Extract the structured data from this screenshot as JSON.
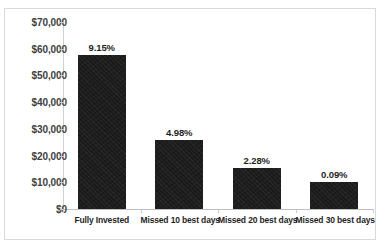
{
  "chart_data": {
    "type": "bar",
    "title": "",
    "xlabel": "",
    "ylabel": "",
    "categories": [
      "Fully Invested",
      "Missed 10 best days",
      "Missed 20 best days",
      "Missed 30 best days"
    ],
    "values": [
      57500,
      26000,
      15400,
      10000
    ],
    "data_labels": [
      "9.15%",
      "4.98%",
      "2.28%",
      "0.09%"
    ],
    "ylim": [
      0,
      70000
    ],
    "ytick_values": [
      0,
      10000,
      20000,
      30000,
      40000,
      50000,
      60000,
      70000
    ],
    "ytick_labels": [
      "$0",
      "$10,000",
      "$20,000",
      "$30,000",
      "$40,000",
      "$50,000",
      "$60,000",
      "$70,000"
    ],
    "grid": false,
    "legend": null,
    "bar_color": "#1a1a1a",
    "frame_color": "#d9d9d9",
    "axis_color": "#c8c8c8",
    "text_color": "#1f1f1f"
  }
}
